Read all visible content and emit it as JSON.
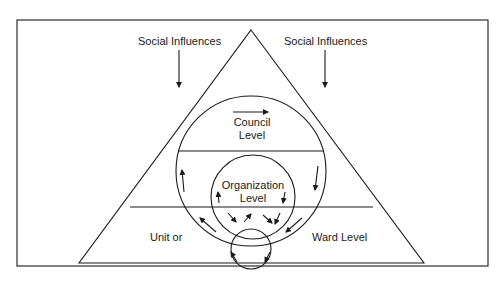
{
  "diagram": {
    "labels": {
      "social_left": "Social Influences",
      "social_right": "Social Influences",
      "council_line1": "Council",
      "council_line2": "Level",
      "org_line1": "Organization",
      "org_line2": "Level",
      "unit": "Unit or",
      "ward": "Ward Level"
    },
    "colors": {
      "stroke": "#1a1a1a",
      "background": "#ffffff"
    }
  }
}
